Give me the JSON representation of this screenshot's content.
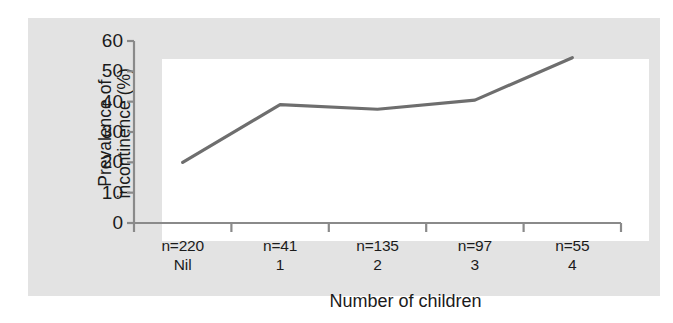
{
  "chart_data": {
    "type": "line",
    "title": "",
    "xlabel": "Number of children",
    "ylabel": "Prevalence of incontinence (%)",
    "ylabel_line1": "Prevalence of",
    "ylabel_line2": "incontinence (%)",
    "categories": [
      "Nil",
      "1",
      "2",
      "3",
      "4"
    ],
    "values": [
      20,
      39,
      37.5,
      40.5,
      54.5
    ],
    "sample_sizes": [
      "n=220",
      "n=41",
      "n=135",
      "n=97",
      "n=55"
    ],
    "ylim": [
      0,
      60
    ],
    "yticks": [
      0,
      10,
      20,
      30,
      40,
      50,
      60
    ],
    "ytick_labels": [
      "0",
      "10",
      "20",
      "30",
      "40",
      "50",
      "60"
    ],
    "grid": false,
    "legend": "none",
    "line_color": "#6e6e6e",
    "axis_color": "#8a8a8a",
    "plot_background": "#ffffff",
    "panel_background": "#e3e3e3",
    "text_color": "#1b1b1b"
  }
}
